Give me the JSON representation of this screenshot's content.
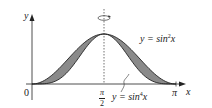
{
  "chart_data": {
    "type": "area",
    "title": "",
    "xlabel": "x",
    "ylabel": "y",
    "x_ticks": [
      "0",
      "π/2",
      "π"
    ],
    "x_range": [
      0,
      3.14159
    ],
    "y_range": [
      0,
      1
    ],
    "grid": false,
    "series": [
      {
        "name": "y = sin²x",
        "function": "sin(x)^2",
        "x": [
          0,
          0.3927,
          0.7854,
          1.1781,
          1.5708,
          1.9635,
          2.3562,
          2.7489,
          3.1416
        ],
        "values": [
          0,
          0.146,
          0.5,
          0.854,
          1,
          0.854,
          0.5,
          0.146,
          0
        ]
      },
      {
        "name": "y = sin⁴x",
        "function": "sin(x)^4",
        "x": [
          0,
          0.3927,
          0.7854,
          1.1781,
          1.5708,
          1.9635,
          2.3562,
          2.7489,
          3.1416
        ],
        "values": [
          0,
          0.021,
          0.25,
          0.729,
          1,
          0.729,
          0.25,
          0.021,
          0
        ]
      }
    ],
    "shaded_region": "between y = sin²x and y = sin⁴x",
    "annotations": [
      "dashed axis of rotation at x = π/2 with rotation arrow"
    ]
  },
  "labels": {
    "y_axis": "y",
    "x_axis": "x",
    "origin": "0",
    "pi_half_num": "π",
    "pi_half_den": "2",
    "pi": "π",
    "curve1_prefix": "y = sin",
    "curve1_exp": "2",
    "curve1_suffix": "x",
    "curve2_prefix": "y = sin",
    "curve2_exp": "4",
    "curve2_suffix": "x"
  },
  "colors": {
    "shade": "#8a8a8a",
    "line": "#222222",
    "background": "#ffffff"
  }
}
